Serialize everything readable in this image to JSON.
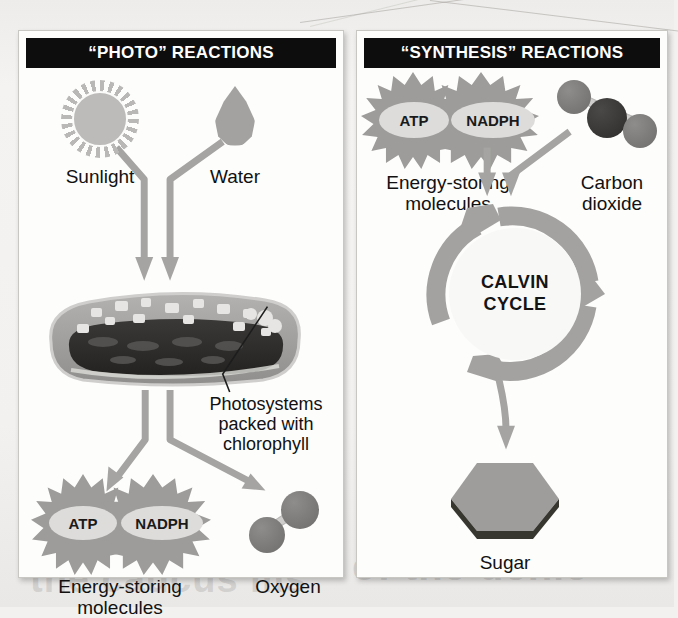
{
  "page": {
    "bleed_text_left": "the caucus ms",
    "bleed_text_right": "of the denie"
  },
  "panels": [
    {
      "id": "photo",
      "title": "“PHOTO” REACTIONS",
      "inputs": [
        {
          "name": "sunlight",
          "label": "Sunlight",
          "icon": "sun-icon"
        },
        {
          "name": "water",
          "label": "Water",
          "icon": "water-drop-icon"
        }
      ],
      "organelle": {
        "name": "thylakoid",
        "callout": "Photosystems\npacked with\nchlorophyll"
      },
      "outputs": [
        {
          "name": "energy-storing-molecules",
          "label": "Energy-storing\nmolecules",
          "badges": [
            "ATP",
            "NADPH"
          ]
        },
        {
          "name": "oxygen",
          "label": "Oxygen",
          "atoms": 2
        }
      ]
    },
    {
      "id": "synthesis",
      "title": "“SYNTHESIS” REACTIONS",
      "inputs": [
        {
          "name": "energy-storing-molecules",
          "label": "Energy-storing\nmolecules",
          "badges": [
            "ATP",
            "NADPH"
          ]
        },
        {
          "name": "carbon-dioxide",
          "label": "Carbon\ndioxide",
          "atoms": 3
        }
      ],
      "cycle": {
        "name": "calvin-cycle",
        "line1": "CALVIN",
        "line2": "CYCLE"
      },
      "outputs": [
        {
          "name": "sugar",
          "label": "Sugar"
        }
      ]
    }
  ],
  "colors": {
    "header_bg": "#0d0d0d",
    "header_text": "#ffffff",
    "panel_bg": "#fdfdfc",
    "page_bg": "#f2f1ef",
    "arrow_gray": "#a5a4a2",
    "burst_gray": "#9d9c9a",
    "pill_gray": "#dddcda",
    "atom_gray": "#7c7b79",
    "atom_dark": "#3a3937",
    "thylakoid_outer": "#a8a7a5",
    "thylakoid_inner": "#2e2d2b",
    "cycle_gray": "#a3a2a0",
    "sugar_gray": "#9e9d9b",
    "text": "#111111"
  }
}
